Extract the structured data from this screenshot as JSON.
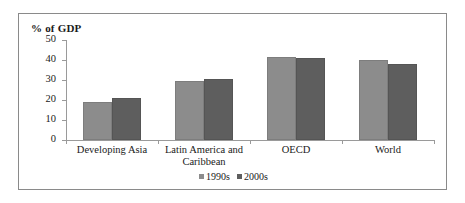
{
  "chart_data": {
    "type": "bar",
    "title": "",
    "ylabel": "% of GDP",
    "xlabel": "",
    "ylim": [
      0,
      50
    ],
    "yticks": [
      0,
      10,
      20,
      30,
      40,
      50
    ],
    "grid": false,
    "legend_position": "bottom-center",
    "categories": [
      "Developing Asia",
      "Latin America and Caribbean",
      "OECD",
      "World"
    ],
    "category_lines": [
      [
        "Developing Asia"
      ],
      [
        "Latin America and",
        "Caribbean"
      ],
      [
        "OECD"
      ],
      [
        "World"
      ]
    ],
    "series": [
      {
        "name": "1990s",
        "color": "#8c8c8c",
        "values": [
          19,
          29.5,
          41.5,
          40
        ]
      },
      {
        "name": "2000s",
        "color": "#5e5e5e",
        "values": [
          21,
          30.5,
          41,
          38
        ]
      }
    ]
  }
}
